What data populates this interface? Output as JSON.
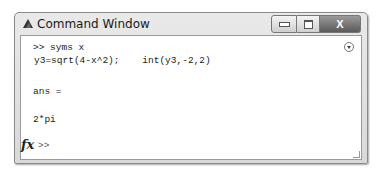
{
  "window": {
    "title": "Command Window",
    "controls": {
      "minimize": "minimize",
      "maximize": "maximize",
      "close": "X"
    }
  },
  "console": {
    "lines": [
      {
        "text": ">> syms x"
      },
      {
        "text": "y3=sqrt(4-x^2);    int(y3,-2,2)"
      },
      {
        "text": "ans ="
      },
      {
        "text": "2*pi"
      }
    ],
    "prompt": ">>",
    "fx_label": "fx"
  },
  "icons": {
    "app": "matlab-logo-icon",
    "menu": "options-menu-icon",
    "function_browser": "fx-icon"
  }
}
